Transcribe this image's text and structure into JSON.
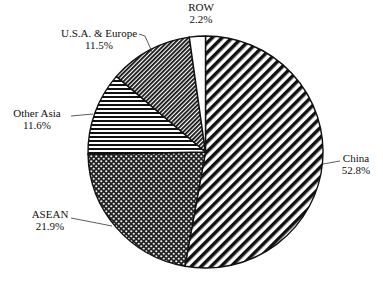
{
  "chart_data": {
    "type": "pie",
    "title": "",
    "start_angle_deg": 0,
    "direction": "clockwise",
    "slices": [
      {
        "label": "China",
        "value": 52.8,
        "value_label": "52.8%",
        "pattern": "diag-wide"
      },
      {
        "label": "ASEAN",
        "value": 21.9,
        "value_label": "21.9%",
        "pattern": "checker"
      },
      {
        "label": "Other Asia",
        "value": 11.6,
        "value_label": "11.6%",
        "pattern": "horizontal"
      },
      {
        "label": "U.S.A. & Europe",
        "value": 11.5,
        "value_label": "11.5%",
        "pattern": "diag-dense"
      },
      {
        "label": "ROW",
        "value": 2.2,
        "value_label": "2.2%",
        "pattern": "none"
      }
    ]
  },
  "colors": {
    "ink": "#111111",
    "background": "#ffffff"
  }
}
